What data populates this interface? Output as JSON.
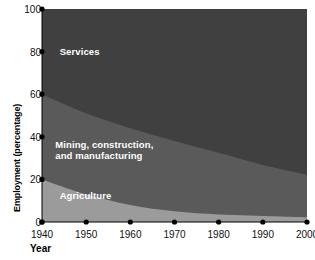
{
  "chart_data": {
    "type": "area",
    "stacked": true,
    "title": "",
    "subtitle": "",
    "xlabel": "Year",
    "ylabel": "Employment (percentage)",
    "xlim": [
      1940,
      2000
    ],
    "ylim": [
      0,
      100
    ],
    "grid": false,
    "legend_position": "inline-annotations",
    "x": [
      1940,
      1950,
      1960,
      1970,
      1980,
      1990,
      2000
    ],
    "xticks": [
      "1940",
      "1950",
      "1960",
      "1970",
      "1980",
      "1990",
      "2000"
    ],
    "yticks": [
      "0",
      "20",
      "40",
      "60",
      "80",
      "100"
    ],
    "series": [
      {
        "name": "Agriculture",
        "color": "#9b9b9b",
        "label_color": "#ffffff",
        "values": [
          20,
          13,
          8,
          5,
          3.5,
          2.8,
          2.2
        ]
      },
      {
        "name": "Mining, construction, and manufacturing",
        "color": "#5a5a5a",
        "label_color": "#ffffff",
        "values": [
          40,
          38,
          36,
          33,
          29,
          24,
          20
        ]
      },
      {
        "name": "Services",
        "color": "#404040",
        "label_color": "#ffffff",
        "values": [
          40,
          49,
          56,
          62,
          67.5,
          73.2,
          77.8
        ]
      }
    ],
    "annotations": [
      {
        "text": "Services",
        "x": 1944,
        "y": 80
      },
      {
        "text": "Mining, construction,",
        "x": 1943,
        "y": 36
      },
      {
        "text": "and manufacturing",
        "x": 1943,
        "y": 31
      },
      {
        "text": "Agriculture",
        "x": 1944,
        "y": 12
      }
    ]
  },
  "axes": {
    "y_title": "Employment (percentage)",
    "x_title": "Year",
    "tick_marker": "filled-dot",
    "tick_color": "#000000"
  },
  "labels": {
    "services": "Services",
    "mining_line1": "Mining, construction,",
    "mining_line2": "and manufacturing",
    "agriculture": "Agriculture"
  },
  "colors": {
    "agriculture": "#9b9b9b",
    "mining": "#5a5a5a",
    "services": "#404040",
    "background": "#ffffff",
    "text": "#111111",
    "annotation_text": "#ffffff"
  }
}
